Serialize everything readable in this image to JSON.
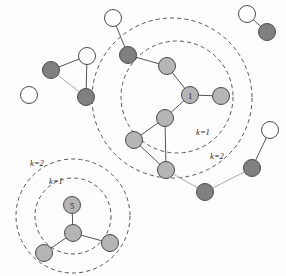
{
  "figure": {
    "type": "graph-diagram",
    "background": "#fdfdfd",
    "width": 286,
    "height": 276
  },
  "palette": {
    "node_dark": "#808080",
    "node_light": "#b5b5b5",
    "node_white": "#ffffff",
    "node_stroke": "#4a4a4a",
    "edge_dark": "#555555",
    "edge_light": "#a9a9a9",
    "ring_stroke": "#555555",
    "label_color": "#1a1a1a"
  },
  "geometry": {
    "node_radius": 8.5,
    "ring_dash": "4,3.2",
    "ring_width": 1.0,
    "edge_width": 1.0,
    "node_stroke_width": 1.0
  },
  "rings": [
    {
      "id": "ring-center-k1",
      "cx": 177,
      "cy": 97,
      "r": 56,
      "label": "k=1",
      "label_x": 203,
      "label_y": 132
    },
    {
      "id": "ring-center-k2",
      "cx": 172,
      "cy": 98,
      "r": 80,
      "label": "k=2",
      "label_x": 217,
      "label_y": 156
    },
    {
      "id": "ring-lower-k1",
      "cx": 73,
      "cy": 216,
      "r": 38,
      "label": "k=1",
      "label_x": 56,
      "label_y": 181
    },
    {
      "id": "ring-lower-k2",
      "cx": 73,
      "cy": 216,
      "r": 57,
      "label": "k=2",
      "label_x": 37,
      "label_y": 163
    }
  ],
  "nodes": [
    {
      "id": "n1",
      "x": 29,
      "y": 95,
      "fill": "white",
      "label": ""
    },
    {
      "id": "n2",
      "x": 51,
      "y": 70,
      "fill": "dark",
      "label": ""
    },
    {
      "id": "n3",
      "x": 87,
      "y": 56,
      "fill": "white",
      "label": ""
    },
    {
      "id": "n4",
      "x": 86,
      "y": 97,
      "fill": "dark",
      "label": ""
    },
    {
      "id": "n5",
      "x": 113,
      "y": 18,
      "fill": "white",
      "label": ""
    },
    {
      "id": "n6",
      "x": 128,
      "y": 55,
      "fill": "dark",
      "label": ""
    },
    {
      "id": "n7",
      "x": 167,
      "y": 66,
      "fill": "light",
      "label": ""
    },
    {
      "id": "n8",
      "x": 190,
      "y": 95,
      "fill": "light",
      "label": "1"
    },
    {
      "id": "n9",
      "x": 221,
      "y": 96,
      "fill": "light",
      "label": ""
    },
    {
      "id": "n10",
      "x": 165,
      "y": 118,
      "fill": "light",
      "label": ""
    },
    {
      "id": "n11",
      "x": 134,
      "y": 140,
      "fill": "light",
      "label": ""
    },
    {
      "id": "n12",
      "x": 166,
      "y": 170,
      "fill": "light",
      "label": ""
    },
    {
      "id": "n13",
      "x": 205,
      "y": 192,
      "fill": "dark",
      "label": ""
    },
    {
      "id": "n14",
      "x": 252,
      "y": 168,
      "fill": "dark",
      "label": ""
    },
    {
      "id": "n15",
      "x": 270,
      "y": 130,
      "fill": "white",
      "label": ""
    },
    {
      "id": "n16",
      "x": 247,
      "y": 14,
      "fill": "white",
      "label": ""
    },
    {
      "id": "n17",
      "x": 267,
      "y": 32,
      "fill": "dark",
      "label": ""
    },
    {
      "id": "n18",
      "x": 72,
      "y": 205,
      "fill": "light",
      "label": "5"
    },
    {
      "id": "n19",
      "x": 73,
      "y": 233,
      "fill": "light",
      "label": ""
    },
    {
      "id": "n20",
      "x": 44,
      "y": 253,
      "fill": "light",
      "label": ""
    },
    {
      "id": "n21",
      "x": 110,
      "y": 243,
      "fill": "light",
      "label": ""
    }
  ],
  "edges": [
    {
      "from": "n2",
      "to": "n3",
      "tone": "dark"
    },
    {
      "from": "n2",
      "to": "n4",
      "tone": "light"
    },
    {
      "from": "n3",
      "to": "n4",
      "tone": "dark"
    },
    {
      "from": "n5",
      "to": "n6",
      "tone": "dark"
    },
    {
      "from": "n6",
      "to": "n7",
      "tone": "dark"
    },
    {
      "from": "n7",
      "to": "n8",
      "tone": "dark"
    },
    {
      "from": "n8",
      "to": "n9",
      "tone": "dark"
    },
    {
      "from": "n8",
      "to": "n10",
      "tone": "dark"
    },
    {
      "from": "n10",
      "to": "n11",
      "tone": "dark"
    },
    {
      "from": "n10",
      "to": "n12",
      "tone": "dark"
    },
    {
      "from": "n11",
      "to": "n12",
      "tone": "dark"
    },
    {
      "from": "n12",
      "to": "n13",
      "tone": "light"
    },
    {
      "from": "n13",
      "to": "n14",
      "tone": "light"
    },
    {
      "from": "n14",
      "to": "n15",
      "tone": "dark"
    },
    {
      "from": "n16",
      "to": "n17",
      "tone": "dark"
    },
    {
      "from": "n18",
      "to": "n19",
      "tone": "dark"
    },
    {
      "from": "n19",
      "to": "n20",
      "tone": "dark"
    },
    {
      "from": "n19",
      "to": "n21",
      "tone": "dark"
    }
  ]
}
